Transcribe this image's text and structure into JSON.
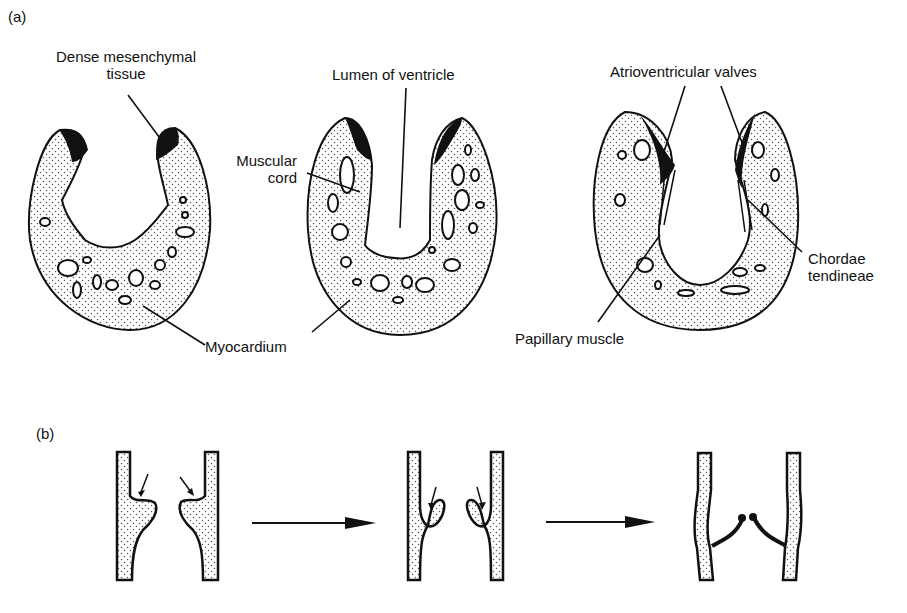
{
  "figure": {
    "panel_a": {
      "label": "(a)",
      "stages": [
        "early",
        "intermediate",
        "mature"
      ],
      "annotations": {
        "dense_mesenchymal_line1": "Dense mesenchymal",
        "dense_mesenchymal_line2": "tissue",
        "lumen": "Lumen of ventricle",
        "muscular_cord_line1": "Muscular",
        "muscular_cord_line2": "cord",
        "av_valves": "Atrioventricular valves",
        "chordae_line1": "Chordae",
        "chordae_line2": "tendineae",
        "myocardium": "Myocardium",
        "papillary": "Papillary muscle"
      }
    },
    "panel_b": {
      "label": "(b)",
      "stages": [
        "cushion outgrowth",
        "undermining",
        "valve leaflets formed"
      ]
    },
    "colors": {
      "ink": "#111111",
      "background": "#ffffff",
      "stipple": "#555555"
    }
  }
}
